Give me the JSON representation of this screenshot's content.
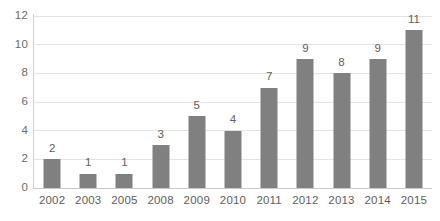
{
  "chart_data": {
    "type": "bar",
    "title": "",
    "subtitle": "",
    "xlabel": "",
    "ylabel": "",
    "categories": [
      "2002",
      "2003",
      "2005",
      "2008",
      "2009",
      "2010",
      "2011",
      "2012",
      "2013",
      "2014",
      "2015"
    ],
    "values": [
      2,
      1,
      1,
      3,
      5,
      4,
      7,
      9,
      8,
      9,
      11
    ],
    "data_labels": [
      "2",
      "1",
      "1",
      "3",
      "5",
      "4",
      "7",
      "9",
      "8",
      "9",
      "11"
    ],
    "ylim": [
      0,
      12
    ],
    "y_ticks": [
      0,
      2,
      4,
      6,
      8,
      10,
      12
    ],
    "y_tick_labels": [
      "0",
      "2",
      "4",
      "6",
      "8",
      "10",
      "12"
    ],
    "grid": true,
    "grid_axis": "y",
    "legend": false,
    "legend_position": "none",
    "bar_color": "#808080",
    "gridline_color": "#e3e3e3",
    "axis_line_color": "#c9c9c9",
    "label_text_color": "#5e5e5e",
    "background_color": "#ffffff",
    "annotations": []
  }
}
